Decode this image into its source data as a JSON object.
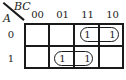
{
  "kmap": {
    "row_variable": "A",
    "col_variable": "BC",
    "col_labels": [
      "00",
      "01",
      "11",
      "10"
    ],
    "row_labels": [
      "0",
      "1"
    ],
    "cells": [
      [
        "",
        "",
        "1",
        "1"
      ],
      [
        "",
        "1",
        "1",
        ""
      ]
    ],
    "groups": [
      {
        "row": 0,
        "cols": [
          2,
          3
        ]
      },
      {
        "row": 1,
        "cols": [
          1,
          2
        ]
      }
    ]
  }
}
